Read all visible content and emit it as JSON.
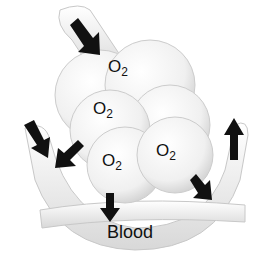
{
  "diagram": {
    "labels": [
      {
        "id": "o2-1",
        "text": "O",
        "sub": "2"
      },
      {
        "id": "o2-2",
        "text": "O",
        "sub": "2"
      },
      {
        "id": "o2-3",
        "text": "O",
        "sub": "2"
      },
      {
        "id": "o2-4",
        "text": "O",
        "sub": "2"
      }
    ],
    "blood_label": "Blood",
    "colors": {
      "arrow": "#111111",
      "tissue": "#f2f2f2",
      "outline": "#bbbbbb"
    }
  }
}
